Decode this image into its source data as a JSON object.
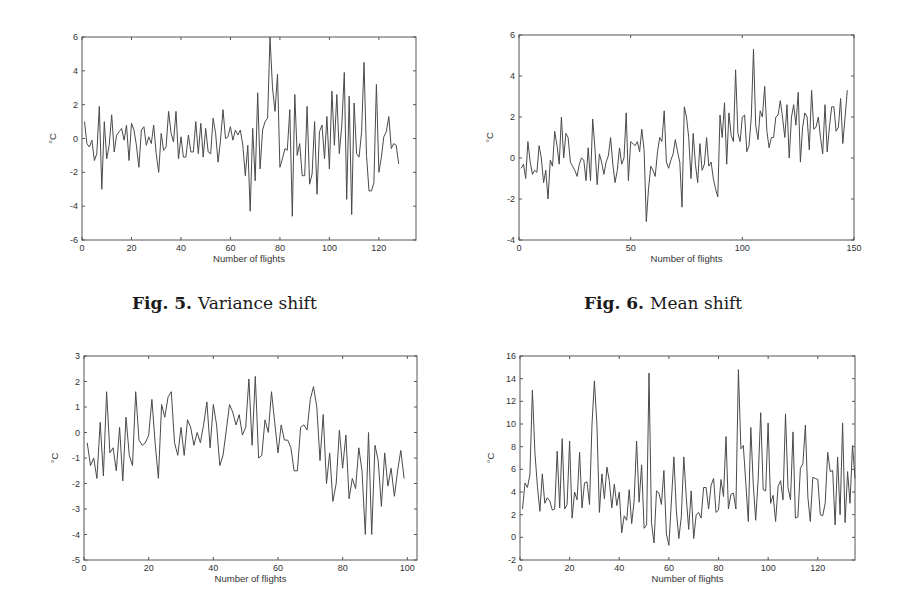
{
  "captions": [
    {
      "num": "Fig. 5.",
      "text": "Variance shift"
    },
    {
      "num": "Fig. 6.",
      "text": "Mean shift"
    }
  ],
  "chart_data": [
    {
      "type": "line",
      "title": "",
      "xlabel": "Number of flights",
      "ylabel": "°C",
      "xlim": [
        0,
        135
      ],
      "ylim": [
        -6,
        6
      ],
      "xticks": [
        0,
        20,
        40,
        60,
        80,
        100,
        120
      ],
      "yticks": [
        -6,
        -4,
        -2,
        0,
        2,
        4,
        6
      ],
      "grid": false,
      "box": {
        "left": 82,
        "top": 37,
        "right": 416,
        "bottom": 240
      },
      "series": [
        {
          "name": "temperature",
          "values": [
            1.0,
            -0.3,
            -0.5,
            -0.1,
            -1.3,
            -0.9,
            1.9,
            -3.0,
            1.0,
            -1.2,
            -0.4,
            1.4,
            -0.8,
            0.2,
            0.4,
            0.6,
            -0.1,
            0.8,
            -1.3,
            0.9,
            0.5,
            -0.4,
            -1.7,
            0.5,
            0.7,
            -0.4,
            0.1,
            -0.3,
            0.8,
            -0.9,
            -2.0,
            0.3,
            -0.7,
            -0.5,
            1.6,
            0.3,
            -0.2,
            1.6,
            -1.2,
            0.1,
            -1.1,
            -1.1,
            0.2,
            -0.8,
            -0.8,
            1.0,
            -0.9,
            0.9,
            -1.1,
            0.6,
            -0.8,
            -0.9,
            1.2,
            0.3,
            -1.4,
            -0.1,
            1.7,
            0.0,
            0.1,
            0.7,
            -0.1,
            0.5,
            0.2,
            0.5,
            -0.4,
            -2.2,
            -0.4,
            -4.3,
            0.6,
            -2.5,
            2.7,
            -1.8,
            0.5,
            1.0,
            1.2,
            6.0,
            3.0,
            1.6,
            3.8,
            -1.7,
            -1.2,
            -0.6,
            -0.7,
            1.7,
            -4.6,
            2.6,
            -1.0,
            -0.3,
            -2.2,
            -2.2,
            1.9,
            -2.7,
            -2.1,
            1.0,
            -3.3,
            0.4,
            0.8,
            -1.2,
            1.3,
            -1.8,
            2.8,
            -0.4,
            2.6,
            -0.9,
            0.8,
            3.9,
            -3.6,
            2.5,
            -4.5,
            2.1,
            -0.9,
            -1.1,
            0.4,
            4.5,
            -1.0,
            -3.1,
            -3.1,
            -2.6,
            3.2,
            -2.0,
            -1.1,
            0.1,
            0.4,
            1.3,
            -0.6,
            -0.3,
            -0.4,
            -1.5
          ]
        }
      ]
    },
    {
      "type": "line",
      "title": "",
      "xlabel": "Number of flights",
      "ylabel": "°C",
      "xlim": [
        0,
        150
      ],
      "ylim": [
        -4,
        6
      ],
      "xticks": [
        0,
        50,
        100,
        150
      ],
      "yticks": [
        -4,
        -2,
        0,
        2,
        4,
        6
      ],
      "grid": false,
      "box": {
        "left": 519,
        "top": 35,
        "right": 854,
        "bottom": 240
      },
      "series": [
        {
          "name": "temperature",
          "values": [
            -0.5,
            -0.3,
            -1.0,
            0.8,
            -0.2,
            -0.8,
            -0.6,
            -0.7,
            0.6,
            0.0,
            -1.2,
            -0.6,
            -2.0,
            -0.1,
            -0.4,
            1.3,
            0.6,
            -0.3,
            2.0,
            0.0,
            1.2,
            1.0,
            -0.2,
            -0.4,
            -0.6,
            -0.9,
            -0.3,
            0.0,
            -0.1,
            -1.1,
            0.5,
            -1.1,
            1.9,
            0.5,
            -1.3,
            0.2,
            -0.2,
            -0.8,
            -0.2,
            0.1,
            1.0,
            -0.3,
            -1.2,
            -0.6,
            0.5,
            -0.3,
            0.0,
            2.2,
            -1.1,
            0.8,
            0.7,
            0.6,
            0.8,
            0.3,
            1.4,
            0.4,
            -3.1,
            -1.5,
            -0.4,
            -0.6,
            -0.9,
            0.3,
            1.0,
            0.8,
            2.3,
            -0.2,
            -0.5,
            -0.1,
            0.2,
            0.9,
            0.3,
            -0.2,
            -2.4,
            2.5,
            2.0,
            1.0,
            -1.0,
            1.2,
            -0.3,
            -1.2,
            0.7,
            -0.6,
            -0.3,
            1.0,
            -0.4,
            -0.2,
            -1.0,
            -1.5,
            -1.9,
            2.1,
            1.0,
            2.7,
            -0.3,
            2.2,
            1.1,
            0.8,
            4.3,
            1.2,
            0.8,
            2.0,
            2.1,
            0.3,
            0.6,
            2.0,
            5.3,
            1.6,
            0.9,
            2.3,
            2.0,
            3.5,
            1.3,
            0.5,
            1.0,
            1.0,
            2.0,
            2.1,
            2.8,
            2.0,
            1.0,
            2.6,
            0.0,
            2.0,
            2.6,
            1.6,
            3.2,
            -0.2,
            1.5,
            2.2,
            2.0,
            0.4,
            3.3,
            1.4,
            1.5,
            2.0,
            1.0,
            0.2,
            2.6,
            0.3,
            1.5,
            2.5,
            2.5,
            1.3,
            1.5,
            2.9,
            0.7,
            2.0,
            3.3
          ]
        }
      ]
    },
    {
      "type": "line",
      "title": "",
      "xlabel": "Number of flights",
      "ylabel": "°C",
      "xlim": [
        0,
        103
      ],
      "ylim": [
        -5,
        3
      ],
      "xticks": [
        0,
        20,
        40,
        60,
        80,
        100
      ],
      "yticks": [
        -5,
        -4,
        -3,
        -2,
        -1,
        0,
        1,
        2,
        3
      ],
      "grid": false,
      "box": {
        "left": 84,
        "top": 356,
        "right": 417,
        "bottom": 560
      },
      "series": [
        {
          "name": "temperature",
          "values": [
            -0.4,
            -1.3,
            -1.0,
            -1.8,
            0.4,
            -1.7,
            1.6,
            -0.8,
            -0.6,
            -1.5,
            0.2,
            -1.9,
            0.6,
            -0.9,
            -1.3,
            1.6,
            -0.3,
            -0.5,
            -0.4,
            -0.1,
            1.3,
            -0.4,
            -1.8,
            1.1,
            0.6,
            1.4,
            1.6,
            -0.4,
            -0.9,
            0.2,
            -0.9,
            0.5,
            0.2,
            -0.5,
            0.0,
            -0.4,
            0.3,
            1.2,
            -0.6,
            1.1,
            0.3,
            -1.3,
            -0.9,
            0.1,
            1.1,
            0.8,
            0.3,
            0.7,
            -0.1,
            0.2,
            2.1,
            -0.5,
            2.2,
            -1.0,
            -0.9,
            0.5,
            0.0,
            1.6,
            0.4,
            -0.8,
            0.3,
            -0.3,
            -0.3,
            -0.6,
            -1.5,
            -1.5,
            0.2,
            0.3,
            0.1,
            1.3,
            1.8,
            1.0,
            -1.1,
            0.7,
            -2.0,
            -0.8,
            -2.7,
            -2.0,
            0.1,
            -1.4,
            -0.1,
            -2.6,
            -1.8,
            -2.2,
            -0.6,
            -1.5,
            -4.0,
            0.0,
            -4.0,
            -0.5,
            -1.1,
            -2.9,
            -0.8,
            -2.1,
            -1.4,
            -2.5,
            -1.5,
            -0.7,
            -1.8
          ]
        }
      ]
    },
    {
      "type": "line",
      "title": "",
      "xlabel": "Number of flights",
      "ylabel": "°C",
      "xlim": [
        0,
        135
      ],
      "ylim": [
        -2,
        16
      ],
      "xticks": [
        0,
        20,
        40,
        60,
        80,
        100,
        120
      ],
      "yticks": [
        -2,
        0,
        2,
        4,
        6,
        8,
        10,
        12,
        14,
        16
      ],
      "grid": false,
      "box": {
        "left": 520,
        "top": 356,
        "right": 855,
        "bottom": 560
      },
      "series": [
        {
          "name": "temperature",
          "values": [
            2.5,
            4.8,
            4.4,
            5.5,
            13.0,
            7.5,
            4.5,
            2.3,
            5.6,
            3.0,
            3.5,
            3.2,
            2.4,
            2.5,
            7.6,
            2.6,
            8.7,
            2.5,
            2.9,
            8.5,
            1.7,
            4.0,
            3.3,
            7.5,
            2.6,
            4.8,
            4.9,
            2.9,
            10.0,
            13.8,
            10.0,
            2.2,
            5.6,
            3.4,
            6.2,
            5.0,
            2.6,
            4.7,
            2.8,
            4.0,
            0.4,
            1.9,
            1.5,
            4.2,
            1.2,
            3.2,
            8.5,
            3.1,
            6.4,
            0.8,
            1.1,
            14.5,
            1.3,
            -0.5,
            4.1,
            3.9,
            2.9,
            5.9,
            0.3,
            -0.7,
            3.2,
            7.1,
            2.4,
            -0.1,
            1.8,
            7.1,
            3.5,
            0.7,
            4.1,
            -0.1,
            2.0,
            2.2,
            1.7,
            4.4,
            4.4,
            2.5,
            4.6,
            5.2,
            2.2,
            2.4,
            5.1,
            3.6,
            8.9,
            2.5,
            3.8,
            3.9,
            2.5,
            14.8,
            7.8,
            8.1,
            4.8,
            1.4,
            9.7,
            4.6,
            1.5,
            5.2,
            11.0,
            4.2,
            4.1,
            10.1,
            3.0,
            3.7,
            1.4,
            4.5,
            5.0,
            3.3,
            10.9,
            4.4,
            3.3,
            9.3,
            1.7,
            1.8,
            6.1,
            6.5,
            9.9,
            3.5,
            1.4,
            5.3,
            5.2,
            5.1,
            2.0,
            1.9,
            3.0,
            7.5,
            5.8,
            5.9,
            1.1,
            7.1,
            2.0,
            10.1,
            1.3,
            5.8,
            3.0,
            8.1,
            5.2
          ]
        }
      ]
    }
  ]
}
